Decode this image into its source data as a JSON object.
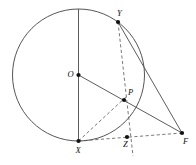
{
  "figure": {
    "type": "geometry-diagram",
    "canvas": {
      "width": 196,
      "height": 165
    },
    "colors": {
      "stroke_solid": "#4a4a4a",
      "stroke_circle": "#555555",
      "stroke_dashed": "#6a6a6a",
      "vertex": "#111111",
      "background": "#ffffff"
    },
    "circle": {
      "name": "main-circle",
      "center_label": "O",
      "cx": 78.5,
      "cy": 75,
      "r": 66
    },
    "points": [
      {
        "id": "O",
        "label": "O",
        "x": 78.5,
        "y": 75,
        "label_dx": -11,
        "label_dy": -5,
        "show_dot": true
      },
      {
        "id": "Y",
        "label": "Y",
        "x": 118,
        "y": 22,
        "label_dx": -1,
        "label_dy": -13,
        "show_dot": true
      },
      {
        "id": "P",
        "label": "P",
        "x": 124,
        "y": 100,
        "label_dx": 4,
        "label_dy": -12,
        "show_dot": true
      },
      {
        "id": "X",
        "label": "X",
        "x": 78.5,
        "y": 141,
        "label_dx": -3,
        "label_dy": 5,
        "show_dot": true
      },
      {
        "id": "Z",
        "label": "Z",
        "x": 127,
        "y": 137,
        "label_dx": -4,
        "label_dy": 3,
        "show_dot": true
      },
      {
        "id": "F",
        "label": "F",
        "x": 182,
        "y": 133,
        "label_dx": 1,
        "label_dy": 4,
        "show_dot": true
      }
    ],
    "segments": [
      {
        "id": "diameter-vertical",
        "name": "segment-top-to-X",
        "style": "solid",
        "x1": 78.5,
        "y1": 9,
        "x2": 78.5,
        "y2": 141
      },
      {
        "id": "O-to-F",
        "name": "segment-O-to-F",
        "style": "solid",
        "x1": 78.5,
        "y1": 75,
        "x2": 182,
        "y2": 133
      },
      {
        "id": "Y-to-F",
        "name": "segment-Y-to-F",
        "style": "solid",
        "x1": 118,
        "y1": 22,
        "x2": 182,
        "y2": 133
      },
      {
        "id": "Y-through-P-to-Z",
        "name": "segment-Y-to-below-Z",
        "style": "dashed",
        "x1": 118,
        "y1": 22,
        "x2": 133,
        "y2": 156
      },
      {
        "id": "X-to-P",
        "name": "segment-X-to-P",
        "style": "dashed",
        "x1": 78.5,
        "y1": 141,
        "x2": 127,
        "y2": 96
      },
      {
        "id": "X-to-F",
        "name": "segment-X-through-Z-to-F",
        "style": "dashed",
        "x1": 78.5,
        "y1": 141,
        "x2": 182,
        "y2": 133
      }
    ]
  }
}
